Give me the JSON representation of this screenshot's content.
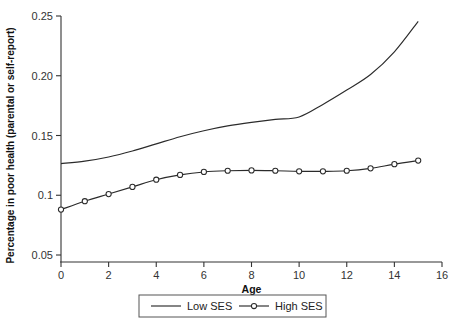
{
  "chart_data": {
    "type": "line",
    "title": "",
    "subtitle": "",
    "xlabel": "Age",
    "ylabel": "Percentage in poor health (parental or self-report)",
    "xlim": [
      0,
      16
    ],
    "ylim": [
      0.05,
      0.25
    ],
    "grid": false,
    "legend_position": "bottom-center",
    "xticks": [
      0,
      2,
      4,
      6,
      8,
      10,
      12,
      14,
      16
    ],
    "xticklabels": [
      "0",
      "2",
      "4",
      "6",
      "8",
      "10",
      "12",
      "14",
      "16"
    ],
    "yticks": [
      0.05,
      0.1,
      0.15,
      0.2,
      0.25
    ],
    "yticklabels": [
      "0.05",
      "0.1",
      "0.15",
      "0.20",
      "0.25"
    ],
    "x": [
      0,
      1,
      2,
      3,
      4,
      5,
      6,
      7,
      8,
      9,
      10,
      11,
      12,
      13,
      14,
      15
    ],
    "series": [
      {
        "name": "Low SES",
        "marker": "none",
        "values": [
          0.1265,
          0.1285,
          0.132,
          0.137,
          0.143,
          0.149,
          0.154,
          0.158,
          0.161,
          0.1635,
          0.1655,
          0.176,
          0.188,
          0.201,
          0.22,
          0.2455
        ]
      },
      {
        "name": "High SES",
        "marker": "circle",
        "values": [
          0.088,
          0.095,
          0.101,
          0.107,
          0.113,
          0.117,
          0.1195,
          0.1205,
          0.1208,
          0.1205,
          0.12,
          0.12,
          0.1205,
          0.1225,
          0.126,
          0.129
        ]
      }
    ],
    "legend": [
      {
        "label": "Low SES",
        "marker": "none"
      },
      {
        "label": "High SES",
        "marker": "circle"
      }
    ]
  },
  "figure": {
    "background_color": "#ffffff",
    "line_color": "#2b2b2b",
    "axis_color": "#333333",
    "marker_fill": "#ffffff"
  }
}
